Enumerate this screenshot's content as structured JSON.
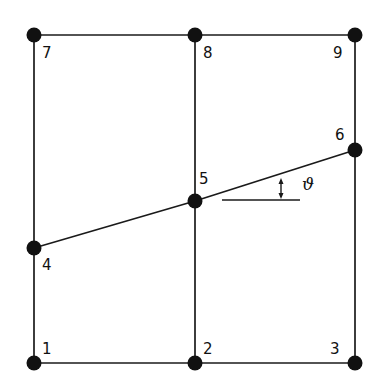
{
  "diagram": {
    "type": "finite-element mesh",
    "colors": {
      "line": "#1a1a1a",
      "node": "#111111",
      "background": "#ffffff"
    },
    "nodes": [
      {
        "id": "1",
        "label": "1",
        "x": 34,
        "y": 363,
        "lx": 42,
        "ly": 354
      },
      {
        "id": "2",
        "label": "2",
        "x": 195,
        "y": 363,
        "lx": 203,
        "ly": 354
      },
      {
        "id": "3",
        "label": "3",
        "x": 355,
        "y": 363,
        "lx": 330,
        "ly": 354
      },
      {
        "id": "4",
        "label": "4",
        "x": 34,
        "y": 248,
        "lx": 42,
        "ly": 270
      },
      {
        "id": "5",
        "label": "5",
        "x": 195,
        "y": 201,
        "lx": 199,
        "ly": 184
      },
      {
        "id": "6",
        "label": "6",
        "x": 355,
        "y": 150,
        "lx": 335,
        "ly": 140
      },
      {
        "id": "7",
        "label": "7",
        "x": 34,
        "y": 35,
        "lx": 42,
        "ly": 58
      },
      {
        "id": "8",
        "label": "8",
        "x": 195,
        "y": 35,
        "lx": 203,
        "ly": 58
      },
      {
        "id": "9",
        "label": "9",
        "x": 355,
        "y": 35,
        "lx": 333,
        "ly": 58
      }
    ],
    "edges": [
      [
        "7",
        "8"
      ],
      [
        "8",
        "9"
      ],
      [
        "1",
        "2"
      ],
      [
        "2",
        "3"
      ],
      [
        "7",
        "4"
      ],
      [
        "4",
        "1"
      ],
      [
        "8",
        "5"
      ],
      [
        "5",
        "2"
      ],
      [
        "9",
        "6"
      ],
      [
        "6",
        "3"
      ],
      [
        "4",
        "5"
      ],
      [
        "5",
        "6"
      ]
    ],
    "angle": {
      "symbol": "ϑ",
      "reference_line": {
        "x1": 222,
        "y1": 200,
        "x2": 300,
        "y2": 200
      },
      "arrow": {
        "x": 281,
        "y_top": 178,
        "y_bottom": 199
      },
      "label_x": 302,
      "label_y": 190
    }
  }
}
